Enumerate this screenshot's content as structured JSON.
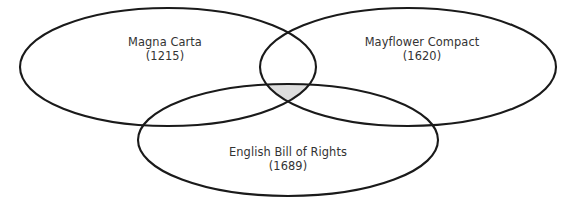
{
  "figure": {
    "type": "venn-diagram",
    "set_count": 3,
    "background_color": "#ffffff",
    "outline_color": "#1a1a1a",
    "text_color": "#333333",
    "intersection_fill": "#dedede"
  },
  "sets": [
    {
      "id": "magna-carta",
      "name": "Magna Carta",
      "year": "(1215)",
      "position": "left"
    },
    {
      "id": "mayflower-compact",
      "name": "Mayflower Compact",
      "year": "(1620)",
      "position": "right"
    },
    {
      "id": "english-bill-of-rights",
      "name": "English Bill of Rights",
      "year": "(1689)",
      "position": "bottom"
    }
  ],
  "shaded_region": {
    "label": "central-intersection",
    "fill": "#dedede",
    "members": [
      "Magna Carta",
      "Mayflower Compact",
      "English Bill of Rights"
    ]
  }
}
